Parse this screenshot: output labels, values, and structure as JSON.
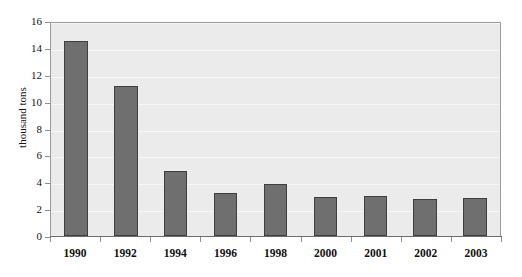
{
  "chart_data": {
    "type": "bar",
    "title": "",
    "subtitle": "",
    "xlabel": "",
    "ylabel": "thousand tons",
    "categories": [
      "1990",
      "1992",
      "1994",
      "1996",
      "1998",
      "2000",
      "2001",
      "2002",
      "2003"
    ],
    "values": [
      14.5,
      11.2,
      4.85,
      3.2,
      3.9,
      2.9,
      3.0,
      2.75,
      2.85
    ],
    "series": [
      {
        "name": "thousand tons",
        "values": [
          14.5,
          11.2,
          4.85,
          3.2,
          3.9,
          2.9,
          3.0,
          2.75,
          2.85
        ]
      }
    ],
    "ylim": [
      0,
      16
    ],
    "yticks": [
      0,
      2,
      4,
      6,
      8,
      10,
      12,
      14,
      16
    ],
    "ytick_labels": [
      "0",
      "2",
      "4",
      "6",
      "8",
      "10",
      "12",
      "14",
      "16"
    ],
    "grid": true,
    "grid_axis": "y",
    "legend": false,
    "legend_position": "none",
    "bar_color": "#6f6f6f",
    "bar_edge_color": "#3f3f3f",
    "plot_background": "#ebebeb",
    "gridline_color": "#f7f7f7",
    "axis_color": "#6d6d6d",
    "figure_background": "#ffffff"
  }
}
